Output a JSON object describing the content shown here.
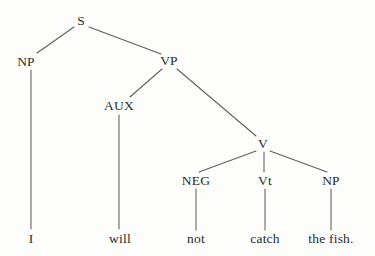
{
  "figure": {
    "kind": "syntax-tree",
    "sentence": "I will not catch the fish.",
    "background_color": "#fdfdfc",
    "line_color": "#5d5d5d",
    "text_color": "#2b2b2b"
  },
  "nodes": [
    {
      "id": "S",
      "label": "S",
      "x": 81,
      "y": 21,
      "type": "category"
    },
    {
      "id": "NP1",
      "label": "NP",
      "x": 26,
      "y": 62,
      "type": "category"
    },
    {
      "id": "VP",
      "label": "VP",
      "x": 169,
      "y": 61,
      "type": "category"
    },
    {
      "id": "AUX",
      "label": "AUX",
      "x": 119,
      "y": 106,
      "type": "category"
    },
    {
      "id": "V",
      "label": "V",
      "x": 263,
      "y": 144,
      "type": "category"
    },
    {
      "id": "NEG",
      "label": "NEG",
      "x": 196,
      "y": 181,
      "type": "category"
    },
    {
      "id": "Vt",
      "label": "Vt",
      "x": 265,
      "y": 181,
      "type": "category"
    },
    {
      "id": "NP2",
      "label": "NP",
      "x": 331,
      "y": 181,
      "type": "category"
    },
    {
      "id": "W1",
      "label": "I",
      "x": 31,
      "y": 239,
      "type": "leaf"
    },
    {
      "id": "W2",
      "label": "will",
      "x": 120,
      "y": 239,
      "type": "leaf"
    },
    {
      "id": "W3",
      "label": "not",
      "x": 196,
      "y": 239,
      "type": "leaf"
    },
    {
      "id": "W4",
      "label": "catch",
      "x": 265,
      "y": 239,
      "type": "leaf"
    },
    {
      "id": "W5",
      "label": "the fish.",
      "x": 331,
      "y": 239,
      "type": "leaf"
    }
  ],
  "edges": [
    {
      "from": "S",
      "to": "NP1",
      "x1": 74,
      "y1": 27,
      "x2": 37,
      "y2": 53
    },
    {
      "from": "S",
      "to": "VP",
      "x1": 89,
      "y1": 27,
      "x2": 161,
      "y2": 54
    },
    {
      "from": "NP1",
      "to": "W1",
      "x1": 31,
      "y1": 70,
      "x2": 31,
      "y2": 229
    },
    {
      "from": "VP",
      "to": "AUX",
      "x1": 162,
      "y1": 69,
      "x2": 130,
      "y2": 97
    },
    {
      "from": "VP",
      "to": "V",
      "x1": 177,
      "y1": 69,
      "x2": 256,
      "y2": 136
    },
    {
      "from": "AUX",
      "to": "W2",
      "x1": 119,
      "y1": 115,
      "x2": 119,
      "y2": 229
    },
    {
      "from": "V",
      "to": "NEG",
      "x1": 256,
      "y1": 151,
      "x2": 199,
      "y2": 172
    },
    {
      "from": "V",
      "to": "Vt",
      "x1": 264,
      "y1": 152,
      "x2": 264,
      "y2": 172
    },
    {
      "from": "V",
      "to": "NP2",
      "x1": 270,
      "y1": 151,
      "x2": 327,
      "y2": 172
    },
    {
      "from": "NEG",
      "to": "W3",
      "x1": 196,
      "y1": 189,
      "x2": 196,
      "y2": 230
    },
    {
      "from": "Vt",
      "to": "W4",
      "x1": 265,
      "y1": 189,
      "x2": 265,
      "y2": 230
    },
    {
      "from": "NP2",
      "to": "W5",
      "x1": 331,
      "y1": 189,
      "x2": 331,
      "y2": 230
    }
  ]
}
